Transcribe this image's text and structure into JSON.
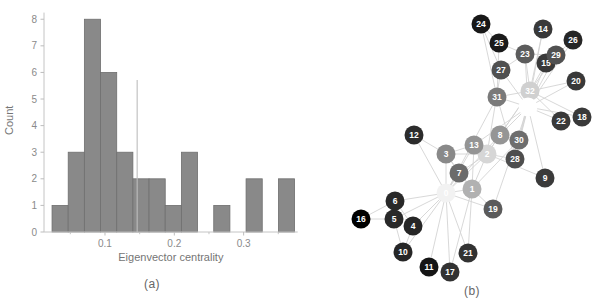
{
  "figure": {
    "panel_a_caption": "(a)",
    "panel_b_caption": "(b)"
  },
  "chart_data": [
    {
      "type": "bar",
      "subtype": "histogram",
      "title": "",
      "xlabel": "Eigenvector centrality",
      "ylabel": "Count",
      "bin_start": 0.0236,
      "bin_width": 0.023327,
      "counts": [
        1,
        3,
        8,
        6,
        3,
        2,
        2,
        1,
        3,
        0,
        1,
        0,
        2,
        0,
        2
      ],
      "mean_line_x": 0.1464,
      "mean_line_top": 5.72,
      "xticks": [
        0.1,
        0.2,
        0.3
      ],
      "xtick_labels": [
        "0.1",
        "0.2",
        "0.3"
      ],
      "xminorticks": [
        0.05,
        0.15,
        0.25,
        0.35
      ],
      "yticks": [
        0,
        1,
        2,
        3,
        4,
        5,
        6,
        7,
        8
      ],
      "xlim": [
        0.012,
        0.378
      ],
      "ylim": [
        0,
        8.4
      ],
      "grid": false,
      "legend": null,
      "colors": {
        "bar_fill": "#898989",
        "bar_edge": "#6f6f6f",
        "mean_line": "#bdbdbd",
        "axis": "#c4c4c4",
        "tick": "#bdbdbd",
        "text": "#757575",
        "tick_text": "#8a8a8a"
      }
    },
    {
      "type": "scatter",
      "subtype": "network-graph",
      "title": "",
      "note": "Zachary karate club graph, nodes shaded by eigenvector centrality (dark = low, light = high)",
      "node_radius": 9.5,
      "colors": {
        "edge": "#d4d4d4",
        "node_label": "#ffffff"
      },
      "nodes": [
        {
          "label": "0",
          "x": 446,
          "y": 193,
          "centrality": 0.3555
        },
        {
          "label": "1",
          "x": 472,
          "y": 189,
          "centrality": 0.266
        },
        {
          "label": "2",
          "x": 487,
          "y": 154,
          "centrality": 0.3172
        },
        {
          "label": "3",
          "x": 446,
          "y": 154,
          "centrality": 0.2112
        },
        {
          "label": "4",
          "x": 413,
          "y": 226,
          "centrality": 0.076
        },
        {
          "label": "5",
          "x": 394,
          "y": 219,
          "centrality": 0.0795
        },
        {
          "label": "6",
          "x": 395,
          "y": 201,
          "centrality": 0.0795
        },
        {
          "label": "7",
          "x": 459,
          "y": 173,
          "centrality": 0.171
        },
        {
          "label": "8",
          "x": 500,
          "y": 135,
          "centrality": 0.2274
        },
        {
          "label": "9",
          "x": 545,
          "y": 178,
          "centrality": 0.1027
        },
        {
          "label": "10",
          "x": 403,
          "y": 252,
          "centrality": 0.076
        },
        {
          "label": "11",
          "x": 429,
          "y": 267,
          "centrality": 0.0528
        },
        {
          "label": "12",
          "x": 414,
          "y": 135,
          "centrality": 0.0843
        },
        {
          "label": "13",
          "x": 474,
          "y": 145,
          "centrality": 0.2265
        },
        {
          "label": "14",
          "x": 543,
          "y": 29,
          "centrality": 0.1014
        },
        {
          "label": "15",
          "x": 546,
          "y": 63,
          "centrality": 0.1014
        },
        {
          "label": "16",
          "x": 361,
          "y": 219,
          "centrality": 0.0236
        },
        {
          "label": "17",
          "x": 450,
          "y": 272,
          "centrality": 0.0924
        },
        {
          "label": "18",
          "x": 582,
          "y": 117,
          "centrality": 0.1014
        },
        {
          "label": "19",
          "x": 493,
          "y": 209,
          "centrality": 0.1479
        },
        {
          "label": "20",
          "x": 576,
          "y": 81,
          "centrality": 0.1014
        },
        {
          "label": "21",
          "x": 468,
          "y": 253,
          "centrality": 0.0924
        },
        {
          "label": "22",
          "x": 561,
          "y": 121,
          "centrality": 0.1014
        },
        {
          "label": "23",
          "x": 525,
          "y": 54,
          "centrality": 0.1501
        },
        {
          "label": "24",
          "x": 481,
          "y": 24,
          "centrality": 0.0571
        },
        {
          "label": "25",
          "x": 499,
          "y": 43,
          "centrality": 0.0592
        },
        {
          "label": "26",
          "x": 573,
          "y": 40,
          "centrality": 0.0756
        },
        {
          "label": "27",
          "x": 501,
          "y": 70,
          "centrality": 0.1335
        },
        {
          "label": "28",
          "x": 515,
          "y": 159,
          "centrality": 0.1311
        },
        {
          "label": "29",
          "x": 556,
          "y": 55,
          "centrality": 0.1349
        },
        {
          "label": "30",
          "x": 519,
          "y": 140,
          "centrality": 0.1747
        },
        {
          "label": "31",
          "x": 497,
          "y": 97,
          "centrality": 0.1911
        },
        {
          "label": "32",
          "x": 530,
          "y": 91,
          "centrality": 0.3086
        },
        {
          "label": "33",
          "x": 528,
          "y": 107,
          "centrality": 0.3735
        }
      ],
      "edges": [
        [
          0,
          1
        ],
        [
          0,
          2
        ],
        [
          0,
          3
        ],
        [
          0,
          4
        ],
        [
          0,
          5
        ],
        [
          0,
          6
        ],
        [
          0,
          7
        ],
        [
          0,
          8
        ],
        [
          0,
          10
        ],
        [
          0,
          11
        ],
        [
          0,
          12
        ],
        [
          0,
          13
        ],
        [
          0,
          17
        ],
        [
          0,
          19
        ],
        [
          0,
          21
        ],
        [
          0,
          31
        ],
        [
          1,
          2
        ],
        [
          1,
          3
        ],
        [
          1,
          7
        ],
        [
          1,
          13
        ],
        [
          1,
          17
        ],
        [
          1,
          19
        ],
        [
          1,
          21
        ],
        [
          1,
          30
        ],
        [
          2,
          3
        ],
        [
          2,
          7
        ],
        [
          2,
          8
        ],
        [
          2,
          9
        ],
        [
          2,
          13
        ],
        [
          2,
          27
        ],
        [
          2,
          28
        ],
        [
          2,
          32
        ],
        [
          3,
          7
        ],
        [
          3,
          12
        ],
        [
          3,
          13
        ],
        [
          4,
          6
        ],
        [
          4,
          10
        ],
        [
          5,
          6
        ],
        [
          5,
          10
        ],
        [
          5,
          16
        ],
        [
          6,
          16
        ],
        [
          8,
          30
        ],
        [
          8,
          32
        ],
        [
          8,
          33
        ],
        [
          9,
          33
        ],
        [
          13,
          33
        ],
        [
          14,
          32
        ],
        [
          14,
          33
        ],
        [
          15,
          32
        ],
        [
          15,
          33
        ],
        [
          18,
          32
        ],
        [
          18,
          33
        ],
        [
          19,
          33
        ],
        [
          20,
          32
        ],
        [
          20,
          33
        ],
        [
          22,
          32
        ],
        [
          22,
          33
        ],
        [
          23,
          25
        ],
        [
          23,
          27
        ],
        [
          23,
          29
        ],
        [
          23,
          32
        ],
        [
          23,
          33
        ],
        [
          24,
          25
        ],
        [
          24,
          27
        ],
        [
          24,
          31
        ],
        [
          25,
          31
        ],
        [
          26,
          29
        ],
        [
          26,
          33
        ],
        [
          27,
          33
        ],
        [
          28,
          31
        ],
        [
          28,
          33
        ],
        [
          29,
          32
        ],
        [
          29,
          33
        ],
        [
          30,
          32
        ],
        [
          30,
          33
        ],
        [
          31,
          32
        ],
        [
          31,
          33
        ],
        [
          32,
          33
        ]
      ]
    }
  ]
}
